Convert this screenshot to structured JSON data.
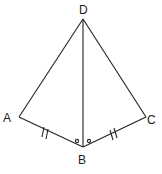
{
  "diagram": {
    "type": "geometry-kite",
    "points": {
      "D": {
        "label": "D",
        "x": 83,
        "y": 19
      },
      "A": {
        "label": "A",
        "x": 19,
        "y": 117
      },
      "B": {
        "label": "B",
        "x": 83,
        "y": 147
      },
      "C": {
        "label": "C",
        "x": 146,
        "y": 117
      }
    },
    "segments": [
      "DA",
      "DB",
      "DC",
      "AB",
      "BC"
    ],
    "congruent_sides": [
      "AB",
      "BC"
    ],
    "congruent_angles": [
      "ABD",
      "DBC"
    ],
    "stroke_color": "#222222"
  }
}
